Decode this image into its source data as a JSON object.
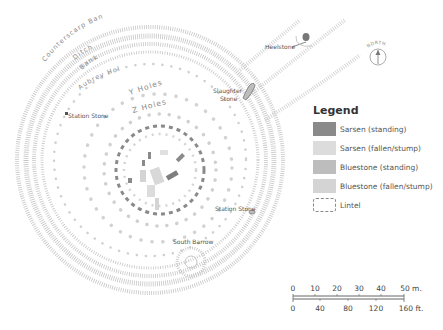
{
  "map": {
    "labels": {
      "counterscarp_bank": "Counterscarp Bank",
      "ditch": "Ditch",
      "bank": "Bank",
      "aubrey_holes": "Aubrey Holes",
      "y_holes": "Y Holes",
      "z_holes": "Z Holes",
      "station_stone_west": "Station Stone",
      "station_stone_southeast": "Station Stone",
      "slaughter_stone_line1": "Slaughter",
      "slaughter_stone_line2": "Stone",
      "heelstone": "Heelstone",
      "south_barrow": "South Barrow"
    },
    "compass": {
      "label": "NORTH",
      "icon": "north-arrow-icon"
    }
  },
  "legend": {
    "title": "Legend",
    "items": [
      {
        "label": "Sarsen (standing)",
        "color": "#8a8a8a",
        "style": "solid"
      },
      {
        "label": "Sarsen (fallen/stump)",
        "color": "#dcdcdc",
        "style": "solid"
      },
      {
        "label": "Bluestone (standing)",
        "color": "#bdbdbd",
        "style": "solid"
      },
      {
        "label": "Bluestone (fallen/stump)",
        "color": "#d4d4d4",
        "style": "solid"
      },
      {
        "label": "Lintel",
        "color": "#ffffff",
        "style": "dashed"
      }
    ]
  },
  "scale_bar": {
    "metric_ticks": [
      "0",
      "10",
      "20",
      "30",
      "40",
      "50 m."
    ],
    "imperial_ticks": [
      "0",
      "40",
      "80",
      "120",
      "160 ft."
    ]
  },
  "colors": {
    "sarsen_standing": "#8a8a8a",
    "sarsen_fallen": "#dcdcdc",
    "bluestone_standing": "#bdbdbd",
    "bluestone_fallen": "#d4d4d4",
    "earthwork": "#c8c8c8",
    "text": "#555555"
  }
}
